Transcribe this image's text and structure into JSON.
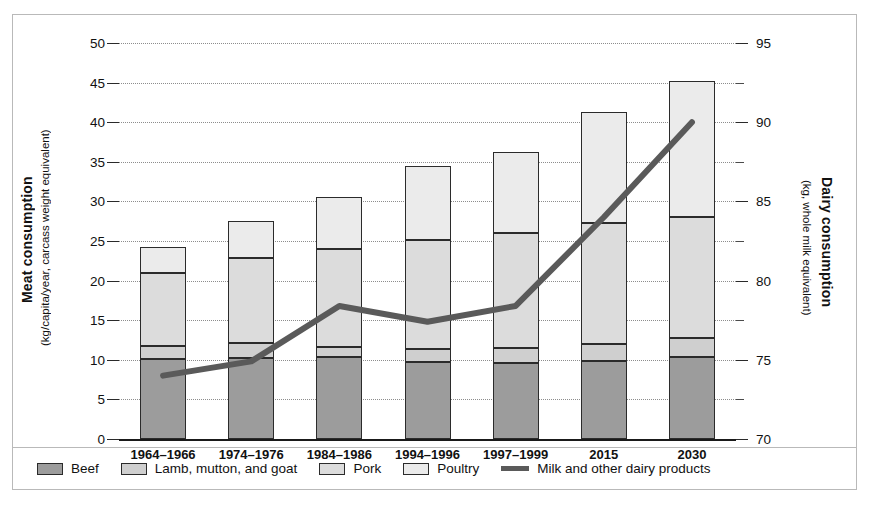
{
  "chart_data": {
    "type": "bar",
    "title": "",
    "categories": [
      "1964–1966",
      "1974–1976",
      "1984–1986",
      "1994–1996",
      "1997–1999",
      "2015",
      "2030"
    ],
    "series": [
      {
        "name": "Beef",
        "values": [
          10.1,
          10.2,
          10.4,
          9.7,
          9.6,
          9.8,
          10.4
        ],
        "color": "#9c9c9c"
      },
      {
        "name": "Lamb, mutton, and goat",
        "values": [
          1.7,
          1.9,
          1.2,
          1.7,
          1.9,
          2.2,
          2.3
        ],
        "color": "#cfcfcf"
      },
      {
        "name": "Pork",
        "values": [
          9.1,
          10.7,
          12.4,
          13.7,
          14.5,
          15.3,
          15.3
        ],
        "color": "#dcdcdc"
      },
      {
        "name": "Poultry",
        "values": [
          3.3,
          4.7,
          6.6,
          9.4,
          10.3,
          14.0,
          17.2
        ],
        "color": "#ebebeb"
      }
    ],
    "stacked_totals": [
      24.2,
      27.5,
      30.6,
      34.5,
      36.3,
      41.3,
      45.2
    ],
    "line_series": {
      "name": "Milk and other dairy products",
      "values": [
        74.0,
        74.9,
        78.4,
        77.4,
        78.4,
        84.0,
        90.0
      ],
      "color": "#5a5a5a",
      "axis": "right"
    },
    "ylabel": "Meat consumption",
    "ylabel_sub": "(kg/capita/year, carcass weight equivalent)",
    "ylim": [
      0,
      50
    ],
    "yticks": [
      0,
      5,
      10,
      15,
      20,
      25,
      30,
      35,
      40,
      45,
      50
    ],
    "y2label": "Dairy consumption",
    "y2label_sub": "(kg, whole milk equivalent)",
    "y2lim": [
      70,
      95
    ],
    "y2ticks": [
      70,
      75,
      80,
      85,
      90,
      95
    ],
    "xlabel": "",
    "grid": true,
    "legend_position": "bottom"
  },
  "axes": {
    "left": {
      "title": "Meat consumption",
      "subtitle": "(kg/capita/year, carcass weight equivalent)",
      "ticks": [
        "0",
        "5",
        "10",
        "15",
        "20",
        "25",
        "30",
        "35",
        "40",
        "45",
        "50"
      ]
    },
    "right": {
      "title": "Dairy consumption",
      "subtitle": "(kg, whole milk equivalent)",
      "ticks": [
        "70",
        "75",
        "80",
        "85",
        "90",
        "95"
      ]
    },
    "x": {
      "ticks": [
        "1964–1966",
        "1974–1976",
        "1984–1986",
        "1994–1996",
        "1997–1999",
        "2015",
        "2030"
      ]
    }
  },
  "legend": {
    "items": [
      {
        "label": "Beef",
        "color": "#9c9c9c",
        "kind": "swatch"
      },
      {
        "label": "Lamb, mutton, and goat",
        "color": "#cfcfcf",
        "kind": "swatch"
      },
      {
        "label": "Pork",
        "color": "#dcdcdc",
        "kind": "swatch"
      },
      {
        "label": "Poultry",
        "color": "#ebebeb",
        "kind": "swatch"
      },
      {
        "label": "Milk and other dairy products",
        "color": "#5a5a5a",
        "kind": "line"
      }
    ]
  }
}
